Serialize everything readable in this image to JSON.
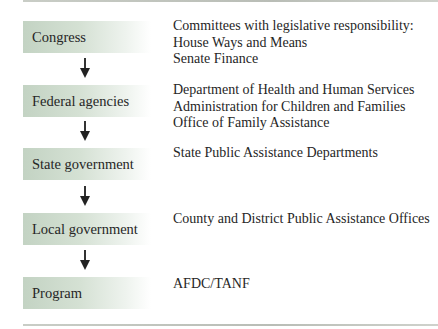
{
  "diagram": {
    "type": "hierarchy-flow",
    "levels": [
      {
        "label": "Congress",
        "details": [
          "Committees with legislative responsibility:",
          "House Ways and Means",
          "Senate Finance"
        ]
      },
      {
        "label": "Federal agencies",
        "details": [
          "Department of Health and Human Services",
          "Administration for Children and Families",
          "Office of Family Assistance"
        ]
      },
      {
        "label": "State government",
        "details": [
          "State Public Assistance Departments"
        ]
      },
      {
        "label": "Local government",
        "details": [
          "County and District Public Assistance Offices"
        ]
      },
      {
        "label": "Program",
        "details": [
          "AFDC/TANF"
        ]
      }
    ],
    "arrows": [
      {
        "from": "Congress",
        "to": "Federal agencies",
        "icon": "arrow-down-icon"
      },
      {
        "from": "Federal agencies",
        "to": "State government",
        "icon": "arrow-down-icon"
      },
      {
        "from": "State government",
        "to": "Local government",
        "icon": "arrow-down-icon"
      },
      {
        "from": "Local government",
        "to": "Program",
        "icon": "arrow-down-icon"
      }
    ],
    "colors": {
      "box_fill_start": "#c3d3c3",
      "box_fill_end": "#ffffff",
      "text": "#262626",
      "arrow": "#222222",
      "rule": "#bfc3bc"
    }
  }
}
